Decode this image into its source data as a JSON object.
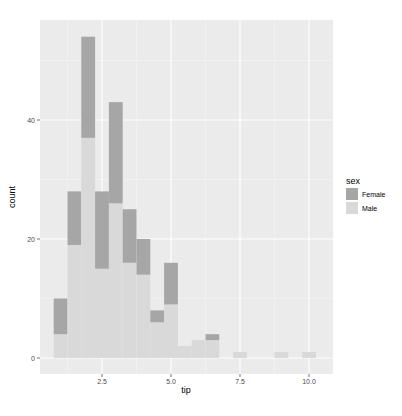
{
  "chart_data": {
    "type": "bar",
    "subtype": "stacked histogram",
    "title": "",
    "xlabel": "tip",
    "ylabel": "count",
    "xlim": [
      0.5,
      10.6
    ],
    "ylim": [
      -2.7,
      57
    ],
    "x_ticks": [
      2.5,
      5.0,
      7.5,
      10.0
    ],
    "x_tick_labels": [
      "2.5",
      "5.0",
      "7.5",
      "10.0"
    ],
    "y_ticks": [
      0,
      20,
      40
    ],
    "y_tick_labels": [
      "0",
      "20",
      "40"
    ],
    "grid": true,
    "legend": {
      "title": "sex",
      "position": "right",
      "entries": [
        {
          "label": "Female",
          "color": "#a6a6a6"
        },
        {
          "label": "Male",
          "color": "#d9d9d9"
        }
      ]
    },
    "bin_width": 0.5,
    "bin_centers": [
      1.0,
      1.5,
      2.0,
      2.5,
      3.0,
      3.5,
      4.0,
      4.5,
      5.0,
      5.5,
      6.0,
      6.5,
      7.5,
      9.0,
      10.0
    ],
    "series": [
      {
        "name": "Female",
        "values": [
          6,
          9,
          17,
          13,
          17,
          9,
          6,
          2,
          7,
          0,
          0,
          1,
          0,
          0,
          0
        ]
      },
      {
        "name": "Male",
        "values": [
          4,
          19,
          37,
          15,
          26,
          16,
          14,
          6,
          9,
          2,
          3,
          3,
          1,
          1,
          1
        ]
      }
    ],
    "totals": [
      10,
      28,
      54,
      28,
      43,
      25,
      20,
      8,
      16,
      2,
      3,
      4,
      1,
      1,
      1
    ]
  },
  "colors": {
    "panel_background": "#ebebeb",
    "grid_major": "#ffffff",
    "female": "#a6a6a6",
    "male": "#d9d9d9"
  }
}
